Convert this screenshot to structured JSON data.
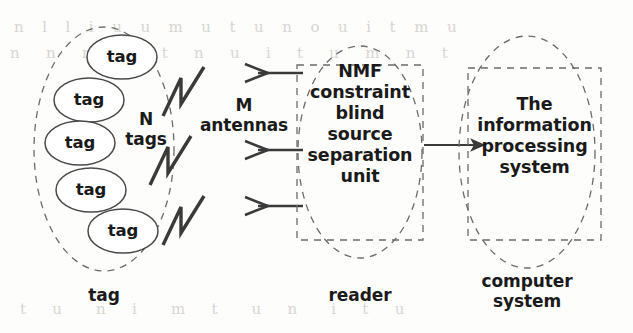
{
  "figure": {
    "type": "block-diagram",
    "stroke_color": "#3a3a3a",
    "text_color": "#1a1a1a",
    "background_color": "#fdfdfc",
    "bleed_color": "#d8d6d2"
  },
  "tag_group": {
    "caption": "tag",
    "count_label": "N\ntags",
    "tags": [
      {
        "label": "tag"
      },
      {
        "label": "tag"
      },
      {
        "label": "tag"
      },
      {
        "label": "tag"
      },
      {
        "label": "tag"
      }
    ]
  },
  "antennas": {
    "count_label": "M\nantennas",
    "signal_count": 3,
    "arrow_count": 3
  },
  "reader": {
    "caption": "reader",
    "body": "NMF\nconstraint\nblind\nsource\nseparation\nunit"
  },
  "computer": {
    "caption": "computer\nsystem",
    "body": "The\ninformation\nprocessing\nsystem"
  },
  "bleed_text": {
    "line1": "n  l  l  i  u  u  m  u  t  u  n  o  u  i  t  m  u",
    "line2": "n   n   n   u    t   n   u   i   t   u   m   n   t",
    "line3": "t   u    n   i    m   t    u   n    i   t   u"
  }
}
